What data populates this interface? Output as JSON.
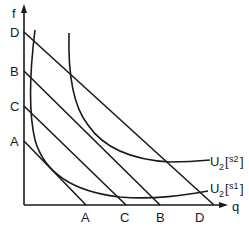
{
  "diagram": {
    "axes": {
      "y_label": "f",
      "x_label": "q"
    },
    "budget_lines": [
      {
        "name": "A",
        "y_intercept_label": "A",
        "x_intercept_label": "A"
      },
      {
        "name": "C",
        "y_intercept_label": "C",
        "x_intercept_label": "C"
      },
      {
        "name": "B",
        "y_intercept_label": "B",
        "x_intercept_label": "B"
      },
      {
        "name": "D",
        "y_intercept_label": "D",
        "x_intercept_label": "D"
      }
    ],
    "curves": [
      {
        "name": "U2[s1]",
        "label_main": "U",
        "label_sub": "2",
        "label_bracket": "s1"
      },
      {
        "name": "U2[s2]",
        "label_main": "U",
        "label_sub": "2",
        "label_bracket": "s2"
      }
    ]
  }
}
